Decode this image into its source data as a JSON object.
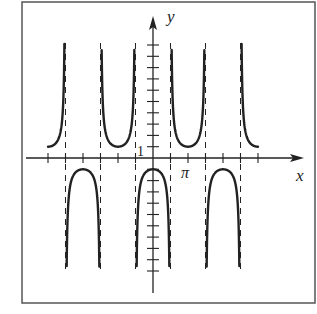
{
  "chart_data": {
    "type": "line",
    "title": "",
    "function": "y = -sec(x)",
    "xlabel": "x",
    "ylabel": "y",
    "x_tick_labels": [
      {
        "value": 3.14159,
        "label": "π"
      }
    ],
    "y_tick_labels": [
      {
        "value": 1,
        "label": "1"
      }
    ],
    "xlim": [
      -9.42,
      9.42
    ],
    "ylim": [
      -10.3,
      10.3
    ],
    "x_tick_step": 1.5708,
    "x_tick_count_each_side": 6,
    "y_tick_step": 1,
    "y_tick_count_each_side": 10,
    "asymptotes": [
      -7.854,
      -4.712,
      -1.5708,
      1.5708,
      4.712,
      7.854
    ],
    "series": [
      {
        "name": "-sec(x)",
        "style": "solid",
        "color": "#222222",
        "key_points": [
          {
            "x": -9.42,
            "y": 1
          },
          {
            "x": -6.283,
            "y": -1
          },
          {
            "x": -3.1416,
            "y": 1
          },
          {
            "x": 0,
            "y": -1
          },
          {
            "x": 3.1416,
            "y": 1
          },
          {
            "x": 6.283,
            "y": -1
          },
          {
            "x": 9.42,
            "y": 1
          }
        ]
      }
    ],
    "grid": false,
    "legend": null
  },
  "labels": {
    "x_axis": "x",
    "y_axis": "y",
    "y_one": "1",
    "x_pi": "π"
  },
  "colors": {
    "ink": "#222222",
    "frame": "#555555",
    "background": "#ffffff"
  }
}
